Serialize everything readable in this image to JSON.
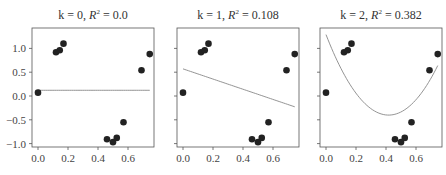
{
  "chart_data": [
    {
      "type": "scatter",
      "title": "k = 0, R² = 0.0",
      "title_parts": {
        "k": "0",
        "r2": "0.0"
      },
      "xlabel": "",
      "ylabel": "",
      "xlim": [
        -0.04,
        0.77
      ],
      "ylim": [
        -1.1,
        1.4
      ],
      "xticks": [
        "0.0",
        "0.2",
        "0.4",
        "0.6"
      ],
      "yticks": [
        "1.0",
        "0.5",
        "0.0",
        "−0.5",
        "−1.0"
      ],
      "grid": false,
      "series": [
        {
          "name": "data",
          "x": [
            0.0,
            0.12,
            0.145,
            0.17,
            0.46,
            0.5,
            0.525,
            0.57,
            0.69,
            0.745
          ],
          "y": [
            0.07,
            0.92,
            0.96,
            1.1,
            -0.91,
            -0.97,
            -0.88,
            -0.55,
            0.54,
            0.88
          ]
        },
        {
          "name": "fit",
          "type": "line",
          "degree": 0,
          "coeffs": [
            0.12
          ]
        }
      ]
    },
    {
      "type": "scatter",
      "title": "k = 1, R² = 0.108",
      "title_parts": {
        "k": "1",
        "r2": "0.108"
      },
      "xlabel": "",
      "ylabel": "",
      "xlim": [
        -0.04,
        0.77
      ],
      "ylim": [
        -1.1,
        1.4
      ],
      "xticks": [
        "0.0",
        "0.2",
        "0.4",
        "0.6"
      ],
      "yticks": [
        "1.0",
        "0.5",
        "0.0",
        "−0.5",
        "−1.0"
      ],
      "grid": false,
      "series": [
        {
          "name": "data",
          "x": [
            0.0,
            0.12,
            0.145,
            0.17,
            0.46,
            0.5,
            0.525,
            0.57,
            0.69,
            0.745
          ],
          "y": [
            0.07,
            0.92,
            0.96,
            1.1,
            -0.91,
            -0.97,
            -0.88,
            -0.55,
            0.54,
            0.88
          ]
        },
        {
          "name": "fit",
          "type": "line",
          "degree": 1,
          "coeffs": [
            0.57,
            -1.07
          ]
        }
      ]
    },
    {
      "type": "scatter",
      "title": "k = 2, R² = 0.382",
      "title_parts": {
        "k": "2",
        "r2": "0.382"
      },
      "xlabel": "",
      "ylabel": "",
      "xlim": [
        -0.04,
        0.77
      ],
      "ylim": [
        -1.1,
        1.4
      ],
      "xticks": [
        "0.0",
        "0.2",
        "0.4",
        "0.6"
      ],
      "yticks": [
        "1.0",
        "0.5",
        "0.0",
        "−0.5",
        "−1.0"
      ],
      "grid": false,
      "series": [
        {
          "name": "data",
          "x": [
            0.0,
            0.12,
            0.145,
            0.17,
            0.46,
            0.5,
            0.525,
            0.57,
            0.69,
            0.745
          ],
          "y": [
            0.07,
            0.92,
            0.96,
            1.1,
            -0.91,
            -0.97,
            -0.88,
            -0.55,
            0.54,
            0.88
          ]
        },
        {
          "name": "fit",
          "type": "line",
          "degree": 2,
          "coeffs": [
            1.29,
            -8.1,
            9.7
          ]
        }
      ]
    }
  ],
  "style": {
    "point_color": "#222222",
    "line_color": "#888888",
    "frame_color": "#555555"
  }
}
